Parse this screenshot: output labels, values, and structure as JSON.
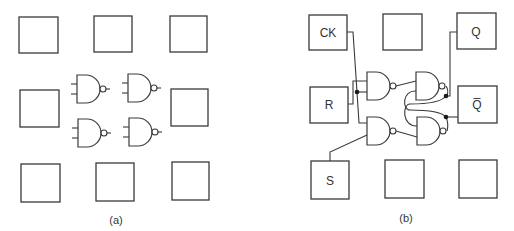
{
  "figure": {
    "panel_a": {
      "caption": "(a)",
      "description": "3x3 grid of empty pads with four unconnected NAND gates in the center",
      "pads": [
        {
          "label": "",
          "x": 19,
          "y": 17,
          "w": 39,
          "h": 36
        },
        {
          "label": "",
          "x": 94,
          "y": 16,
          "w": 38,
          "h": 36
        },
        {
          "label": "",
          "x": 170,
          "y": 16,
          "w": 37,
          "h": 36
        },
        {
          "label": "",
          "x": 20,
          "y": 90,
          "w": 39,
          "h": 37
        },
        {
          "label": "",
          "x": 171,
          "y": 89,
          "w": 37,
          "h": 37
        },
        {
          "label": "",
          "x": 21,
          "y": 164,
          "w": 39,
          "h": 38
        },
        {
          "label": "",
          "x": 96,
          "y": 163,
          "w": 38,
          "h": 38
        },
        {
          "label": "",
          "x": 172,
          "y": 162,
          "w": 37,
          "h": 38
        }
      ],
      "gates": [
        {
          "type": "NAND",
          "x": 77,
          "y": 74
        },
        {
          "type": "NAND",
          "x": 128,
          "y": 74
        },
        {
          "type": "NAND",
          "x": 78,
          "y": 119
        },
        {
          "type": "NAND",
          "x": 129,
          "y": 118
        }
      ]
    },
    "panel_b": {
      "caption": "(b)",
      "description": "Clocked SR flip-flop wired from NAND gates to pads",
      "pads": [
        {
          "label": "CK",
          "x": 309,
          "y": 15,
          "w": 38,
          "h": 35
        },
        {
          "label": "",
          "x": 383,
          "y": 14,
          "w": 39,
          "h": 36
        },
        {
          "label": "Q",
          "x": 457,
          "y": 13,
          "w": 39,
          "h": 36
        },
        {
          "label": "R",
          "x": 310,
          "y": 87,
          "w": 38,
          "h": 36
        },
        {
          "label": "Q̅",
          "x": 458,
          "y": 86,
          "w": 39,
          "h": 37
        },
        {
          "label": "S",
          "x": 311,
          "y": 161,
          "w": 38,
          "h": 38
        },
        {
          "label": "",
          "x": 385,
          "y": 160,
          "w": 39,
          "h": 38
        },
        {
          "label": "",
          "x": 459,
          "y": 160,
          "w": 38,
          "h": 38
        }
      ],
      "gates": [
        {
          "type": "NAND",
          "x": 367,
          "y": 72,
          "role": "input gate R"
        },
        {
          "type": "NAND",
          "x": 367,
          "y": 117,
          "role": "input gate S"
        },
        {
          "type": "NAND",
          "x": 416,
          "y": 72,
          "role": "latch gate Q"
        },
        {
          "type": "NAND",
          "x": 417,
          "y": 118,
          "role": "latch gate Q-bar"
        }
      ],
      "signals": [
        "CK",
        "R",
        "S",
        "Q",
        "Q̅"
      ]
    }
  }
}
